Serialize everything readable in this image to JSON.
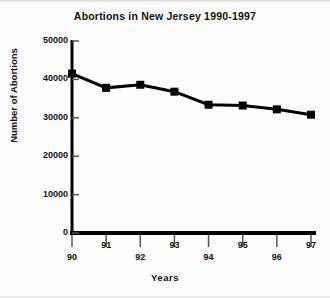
{
  "chart_data": {
    "type": "line",
    "title": "Abortions in New Jersey 1990-1997",
    "xlabel": "Years",
    "ylabel": "Number of Abortions",
    "categories": [
      "90",
      "91",
      "92",
      "93",
      "94",
      "95",
      "96",
      "97"
    ],
    "values": [
      41500,
      37800,
      38600,
      36800,
      33400,
      33200,
      32200,
      30800
    ],
    "ylim": [
      0,
      50000
    ],
    "ytick_labels": [
      "50000",
      "40000",
      "30000",
      "20000",
      "10000",
      "0"
    ],
    "ytick_values": [
      50000,
      40000,
      30000,
      20000,
      10000,
      0
    ],
    "xtick_labels": [
      "90",
      "91",
      "92",
      "93",
      "94",
      "95",
      "96",
      "97"
    ],
    "grid": false,
    "legend": "none",
    "marker": "square",
    "series_color": "#000000"
  }
}
